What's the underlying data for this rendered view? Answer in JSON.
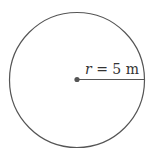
{
  "diagram": {
    "shape": "circle",
    "radius_label": {
      "variable": "r",
      "equals": " = ",
      "value": "5",
      "unit": " m"
    },
    "colors": {
      "stroke": "#555555",
      "center_dot": "#555555",
      "text": "#333333",
      "background": "#ffffff"
    }
  }
}
